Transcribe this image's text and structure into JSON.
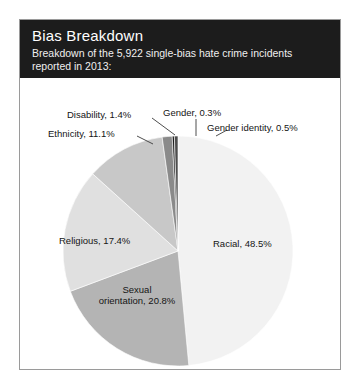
{
  "card": {
    "title": "Bias Breakdown",
    "subtitle": "Breakdown of the 5,922 single-bias hate crime incidents reported in 2013:"
  },
  "chart_data": {
    "type": "pie",
    "title": "Bias Breakdown",
    "subtitle": "Breakdown of the 5,922 single-bias hate crime incidents reported in 2013:",
    "total_incidents": 5922,
    "year": 2013,
    "units": "percent",
    "start_angle_deg": 0,
    "direction": "clockwise",
    "legend": "none",
    "grid": false,
    "categories": [
      "Racial",
      "Sexual orientation",
      "Religious",
      "Ethnicity",
      "Disability",
      "Gender",
      "Gender identity"
    ],
    "values": [
      48.5,
      20.8,
      17.4,
      11.1,
      1.4,
      0.3,
      0.5
    ],
    "colors": [
      "#f2f2f2",
      "#b4b4b4",
      "#e0e0e0",
      "#c8c8c8",
      "#8a8a8a",
      "#1a1a1a",
      "#4d4d4d"
    ],
    "labels": [
      {
        "name": "Racial",
        "text": "Racial, 48.5%",
        "value": 48.5
      },
      {
        "name": "Sexual orientation",
        "text": "Sexual orientation, 20.8%",
        "value": 20.8
      },
      {
        "name": "Religious",
        "text": "Religious, 17.4%",
        "value": 17.4
      },
      {
        "name": "Ethnicity",
        "text": "Ethnicity, 11.1%",
        "value": 11.1
      },
      {
        "name": "Disability",
        "text": "Disability, 1.4%",
        "value": 1.4
      },
      {
        "name": "Gender",
        "text": "Gender, 0.3%",
        "value": 0.3
      },
      {
        "name": "Gender identity",
        "text": "Gender identity, 0.5%",
        "value": 0.5
      }
    ]
  },
  "labels": {
    "racial": "Racial, 48.5%",
    "sexual_orientation_line1": "Sexual",
    "sexual_orientation_line2": "orientation, 20.8%",
    "religious": "Religious, 17.4%",
    "ethnicity": "Ethnicity, 11.1%",
    "disability": "Disability, 1.4%",
    "gender": "Gender, 0.3%",
    "gender_identity": "Gender identity, 0.5%"
  }
}
